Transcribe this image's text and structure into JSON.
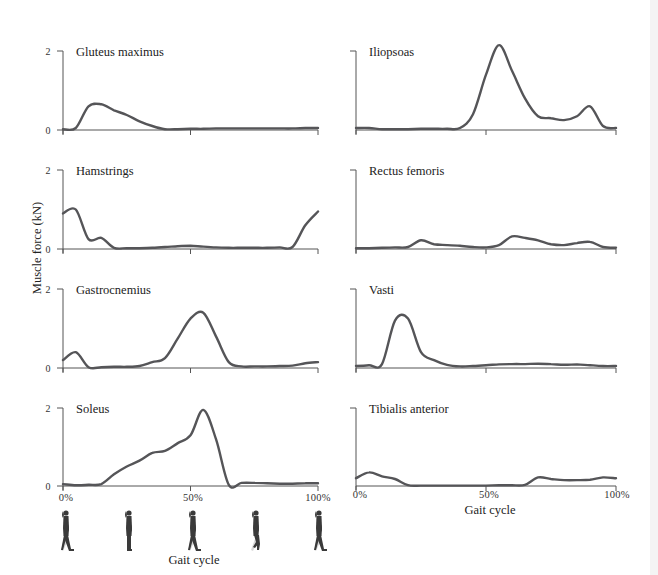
{
  "figure": {
    "ylabel": "Muscle force (kN)",
    "xlabel_left": "Gait cycle",
    "xlabel_right": "Gait cycle",
    "xticks": [
      "0%",
      "50%",
      "100%"
    ],
    "yticks": [
      "0",
      "2"
    ],
    "colors": {
      "curve": "#555558",
      "axis": "#555555",
      "text": "#222222",
      "walker_dark": "#3a3a3a",
      "walker_light": "#d8d8d8"
    },
    "walking_figures": [
      "heel-strike",
      "mid-stance",
      "terminal-stance",
      "swing",
      "heel-strike"
    ]
  },
  "panels": [
    {
      "title": "Gluteus maximus"
    },
    {
      "title": "Iliopsoas"
    },
    {
      "title": "Hamstrings"
    },
    {
      "title": "Rectus femoris"
    },
    {
      "title": "Gastrocnemius"
    },
    {
      "title": "Vasti"
    },
    {
      "title": "Soleus"
    },
    {
      "title": "Tibialis anterior"
    }
  ],
  "chart_data": {
    "type": "line",
    "title": "",
    "xlabel": "Gait cycle",
    "ylabel": "Muscle force (kN)",
    "x_unit": "% gait cycle",
    "ylim": [
      0,
      2
    ],
    "xlim": [
      0,
      100
    ],
    "grid": false,
    "layout": "4x2 small multiples",
    "x": [
      0,
      5,
      10,
      15,
      20,
      25,
      30,
      35,
      40,
      45,
      50,
      55,
      60,
      65,
      70,
      75,
      80,
      85,
      90,
      95,
      100
    ],
    "series": [
      {
        "name": "Gluteus maximus",
        "values": [
          0.02,
          0.05,
          0.6,
          0.65,
          0.5,
          0.38,
          0.22,
          0.1,
          0.02,
          0.02,
          0.03,
          0.03,
          0.04,
          0.04,
          0.04,
          0.04,
          0.04,
          0.04,
          0.04,
          0.05,
          0.05
        ]
      },
      {
        "name": "Iliopsoas",
        "values": [
          0.05,
          0.05,
          0.02,
          0.02,
          0.02,
          0.03,
          0.03,
          0.03,
          0.05,
          0.4,
          1.4,
          2.15,
          1.5,
          0.8,
          0.35,
          0.3,
          0.25,
          0.35,
          0.6,
          0.1,
          0.05
        ]
      },
      {
        "name": "Hamstrings",
        "values": [
          0.9,
          1.0,
          0.25,
          0.28,
          0.03,
          0.02,
          0.02,
          0.03,
          0.05,
          0.07,
          0.08,
          0.06,
          0.04,
          0.03,
          0.03,
          0.03,
          0.03,
          0.04,
          0.05,
          0.6,
          0.95
        ]
      },
      {
        "name": "Rectus femoris",
        "values": [
          0.02,
          0.02,
          0.03,
          0.04,
          0.05,
          0.22,
          0.12,
          0.1,
          0.08,
          0.05,
          0.04,
          0.1,
          0.32,
          0.28,
          0.22,
          0.12,
          0.1,
          0.15,
          0.18,
          0.05,
          0.03
        ]
      },
      {
        "name": "Gastrocnemius",
        "values": [
          0.2,
          0.4,
          0.02,
          0.02,
          0.03,
          0.03,
          0.05,
          0.15,
          0.25,
          0.75,
          1.25,
          1.4,
          0.8,
          0.15,
          0.04,
          0.04,
          0.04,
          0.05,
          0.06,
          0.12,
          0.15
        ]
      },
      {
        "name": "Vasti",
        "values": [
          0.05,
          0.07,
          0.1,
          1.2,
          1.25,
          0.4,
          0.2,
          0.08,
          0.04,
          0.05,
          0.07,
          0.09,
          0.1,
          0.1,
          0.11,
          0.1,
          0.08,
          0.09,
          0.07,
          0.05,
          0.05
        ]
      },
      {
        "name": "Soleus",
        "values": [
          0.05,
          0.02,
          0.03,
          0.05,
          0.3,
          0.5,
          0.65,
          0.85,
          0.9,
          1.1,
          1.3,
          1.95,
          1.2,
          0.03,
          0.08,
          0.08,
          0.07,
          0.06,
          0.06,
          0.07,
          0.07
        ]
      },
      {
        "name": "Tibialis anterior",
        "values": [
          0.2,
          0.35,
          0.25,
          0.18,
          0.02,
          0.01,
          0.01,
          0.01,
          0.01,
          0.01,
          0.01,
          0.02,
          0.02,
          0.03,
          0.22,
          0.18,
          0.15,
          0.15,
          0.16,
          0.22,
          0.2
        ]
      }
    ]
  }
}
